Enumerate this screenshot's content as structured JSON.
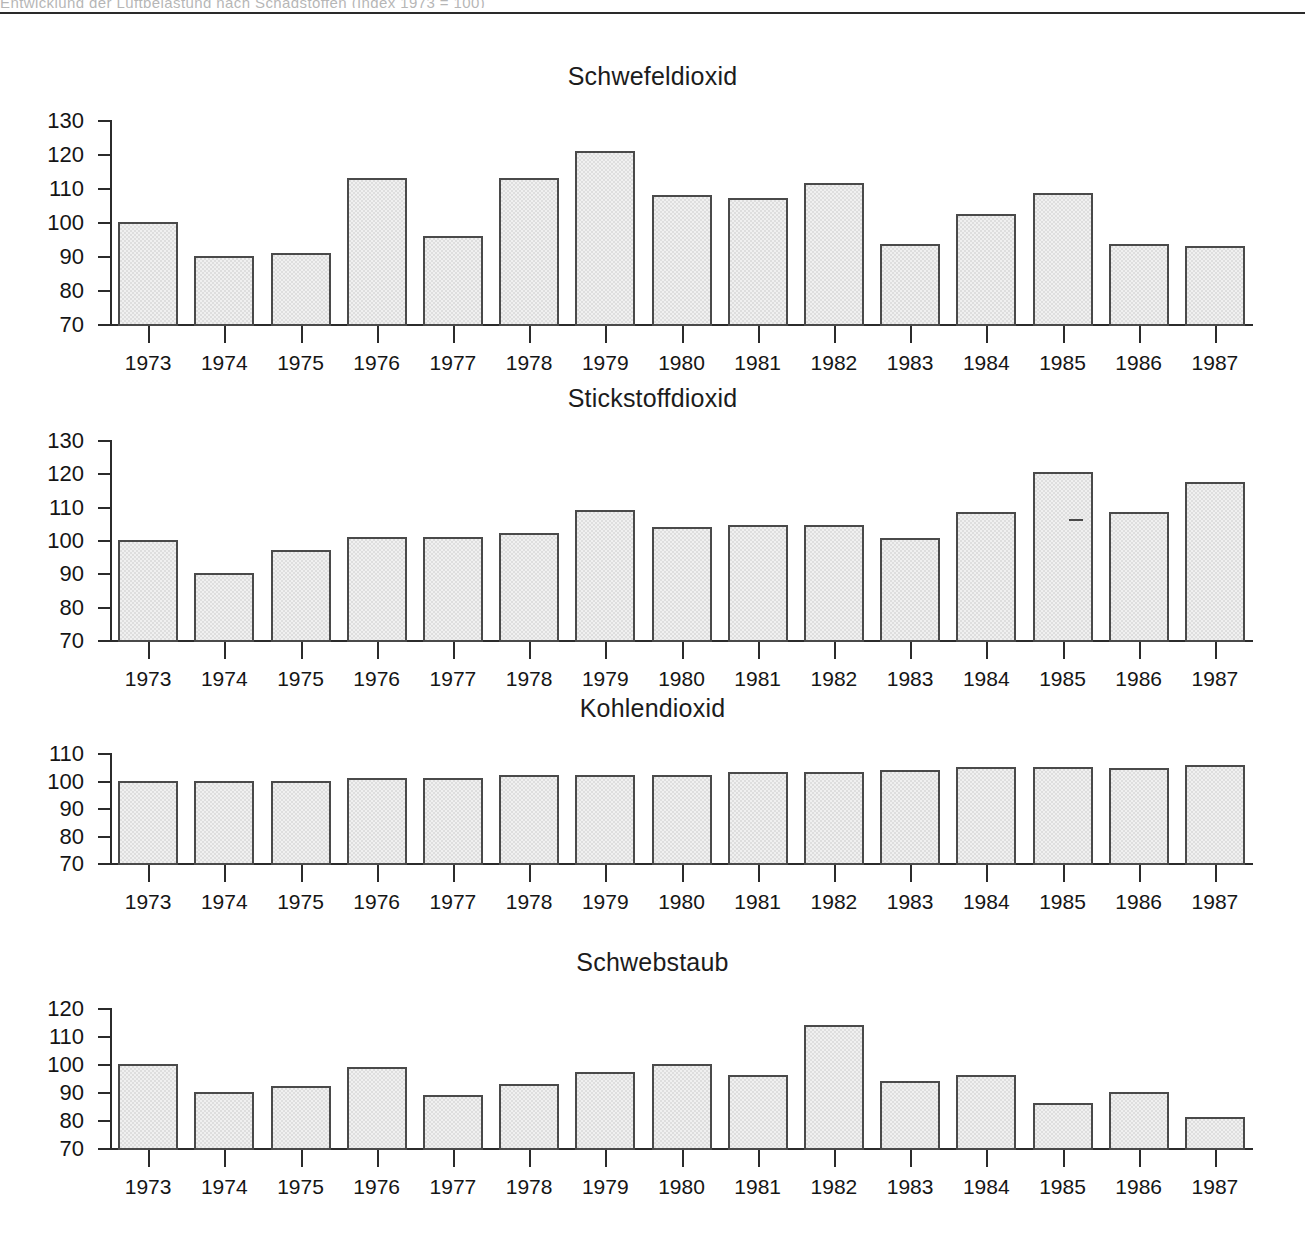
{
  "page": {
    "top_cropped_text": "Entwicklung der Luftbelastung nach Schadstoffen (Index 1973 = 100)",
    "header_rule_color": "#2a2a2a",
    "background_color": "#ffffff"
  },
  "style": {
    "bar_fill": "#dedede",
    "bar_border": "#4a4a4a",
    "axis_color": "#2b2b2b",
    "text_color": "#151515"
  },
  "chart_data": [
    {
      "type": "bar",
      "title": "Schwefeldioxid",
      "xlabel": "",
      "ylabel": "",
      "ylim": [
        70,
        130
      ],
      "yticks": [
        70,
        80,
        90,
        100,
        110,
        120,
        130
      ],
      "grid": false,
      "legend": "none",
      "categories": [
        "1973",
        "1974",
        "1975",
        "1976",
        "1977",
        "1978",
        "1979",
        "1980",
        "1981",
        "1982",
        "1983",
        "1984",
        "1985",
        "1986",
        "1987"
      ],
      "values": [
        100,
        90,
        91,
        113,
        96,
        113,
        121,
        108,
        107,
        111.5,
        93.5,
        102.5,
        108.5,
        93.5,
        93
      ]
    },
    {
      "type": "bar",
      "title": "Stickstoffdioxid",
      "xlabel": "",
      "ylabel": "",
      "ylim": [
        70,
        130
      ],
      "yticks": [
        70,
        80,
        90,
        100,
        110,
        120,
        130
      ],
      "grid": false,
      "legend": "none",
      "categories": [
        "1973",
        "1974",
        "1975",
        "1976",
        "1977",
        "1978",
        "1979",
        "1980",
        "1981",
        "1982",
        "1983",
        "1984",
        "1985",
        "1986",
        "1987"
      ],
      "values": [
        100,
        90,
        97,
        101,
        101,
        102,
        109,
        104,
        104.5,
        104.5,
        100.5,
        108.5,
        120.5,
        108.5,
        117.5
      ]
    },
    {
      "type": "bar",
      "title": "Kohlendioxid",
      "xlabel": "",
      "ylabel": "",
      "ylim": [
        70,
        110
      ],
      "yticks": [
        70,
        80,
        90,
        100,
        110
      ],
      "grid": false,
      "legend": "none",
      "categories": [
        "1973",
        "1974",
        "1975",
        "1976",
        "1977",
        "1978",
        "1979",
        "1980",
        "1981",
        "1982",
        "1983",
        "1984",
        "1985",
        "1986",
        "1987"
      ],
      "values": [
        100,
        100,
        100,
        101,
        101,
        102,
        102,
        102,
        103,
        103,
        103.8,
        104.8,
        104.8,
        104.7,
        105.8
      ]
    },
    {
      "type": "bar",
      "title": "Schwebstaub",
      "xlabel": "",
      "ylabel": "",
      "ylim": [
        70,
        120
      ],
      "yticks": [
        70,
        80,
        90,
        100,
        110,
        120
      ],
      "grid": false,
      "legend": "none",
      "categories": [
        "1973",
        "1974",
        "1975",
        "1976",
        "1977",
        "1978",
        "1979",
        "1980",
        "1981",
        "1982",
        "1983",
        "1984",
        "1985",
        "1986",
        "1987"
      ],
      "values": [
        100,
        90,
        92,
        99,
        89,
        93,
        97,
        100,
        96,
        114,
        94,
        96,
        86,
        90,
        81
      ]
    }
  ]
}
